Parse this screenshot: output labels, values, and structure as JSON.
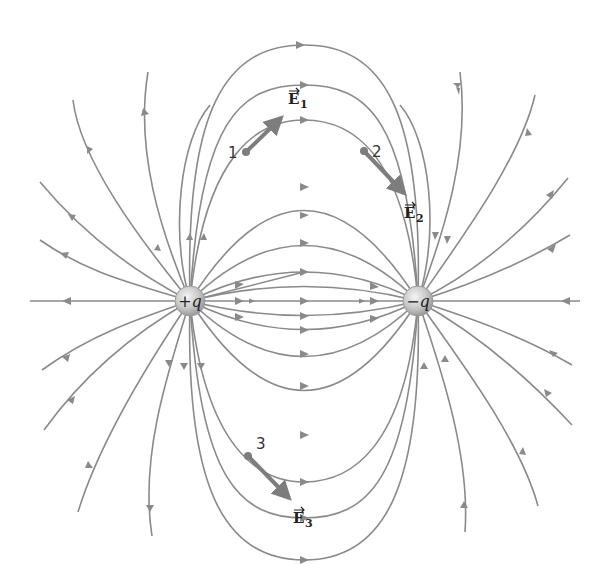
{
  "diagram": {
    "charges": [
      {
        "id": "positive",
        "label": "+q",
        "x": 190,
        "y": 301
      },
      {
        "id": "negative",
        "label": "−q",
        "x": 418,
        "y": 301
      }
    ],
    "points": [
      {
        "id": "1",
        "label": "1",
        "x": 246,
        "y": 152,
        "vector_label": "E",
        "vector_sub": "1"
      },
      {
        "id": "2",
        "label": "2",
        "x": 364,
        "y": 151,
        "vector_label": "E",
        "vector_sub": "2"
      },
      {
        "id": "3",
        "label": "3",
        "x": 248,
        "y": 456,
        "vector_label": "E",
        "vector_sub": "3"
      }
    ],
    "colors": {
      "field_line": "#8a8a8a",
      "vector": "#7d7d7d",
      "charge_sphere": "#c9c9c9",
      "text": "#222222"
    }
  }
}
